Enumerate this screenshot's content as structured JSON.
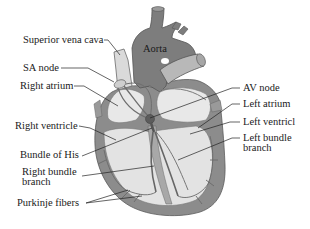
{
  "diagram": {
    "colors": {
      "background": "#ffffff",
      "outer_wall": "#8c8c8c",
      "aorta": "#7d7d7d",
      "chamber_fill": "#e6e6e6",
      "vessel_light": "#cfcfcf",
      "conduction_path": "#6e6e6e",
      "label_text": "#1a1a1a",
      "leader_line": "#222222"
    },
    "structure_labels": {
      "aorta": "Aorta"
    },
    "labels_left": [
      {
        "id": "superior-vena-cava",
        "text": "Superior vena cava"
      },
      {
        "id": "sa-node",
        "text": "SA node"
      },
      {
        "id": "right-atrium",
        "text": "Right atrium"
      },
      {
        "id": "right-ventricle",
        "text": "Right ventricle"
      },
      {
        "id": "bundle-of-his",
        "text": "Bundle of His"
      },
      {
        "id": "right-bundle-branch",
        "line1": "Right bundle",
        "line2": "branch"
      },
      {
        "id": "purkinje-fibers",
        "text": "Purkinje fibers"
      }
    ],
    "labels_right": [
      {
        "id": "av-node",
        "text": "AV node"
      },
      {
        "id": "left-atrium",
        "text": "Left atrium"
      },
      {
        "id": "left-ventricle",
        "text": "Left ventricl"
      },
      {
        "id": "left-bundle-branch",
        "line1": "Left bundle",
        "line2": "branch"
      }
    ]
  }
}
